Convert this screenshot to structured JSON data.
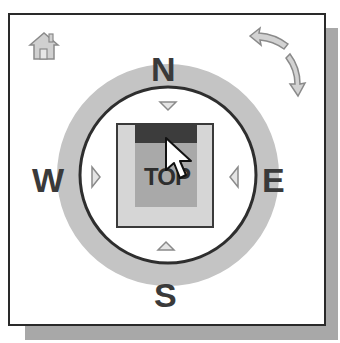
{
  "widget": {
    "name": "ViewCube",
    "current_view": "TOP",
    "compass": {
      "north": "N",
      "south": "S",
      "east": "E",
      "west": "W"
    },
    "buttons": {
      "home": "home-icon",
      "rotate": "rotate-arrows-icon",
      "pan_up": "triangle-down",
      "pan_down": "triangle-up",
      "pan_left": "triangle-right",
      "pan_right": "triangle-left"
    }
  },
  "colors": {
    "frame_border": "#2a2a2a",
    "shadow": "#a8a8a8",
    "ring": "#c4c4c4",
    "ring_stroke": "#2e2e2e",
    "cube_outer": "#d6d6d6",
    "cube_face": "#a9a9a9",
    "cube_edge_highlight": "#3c3c3c",
    "letters": "#3a3a3a"
  }
}
